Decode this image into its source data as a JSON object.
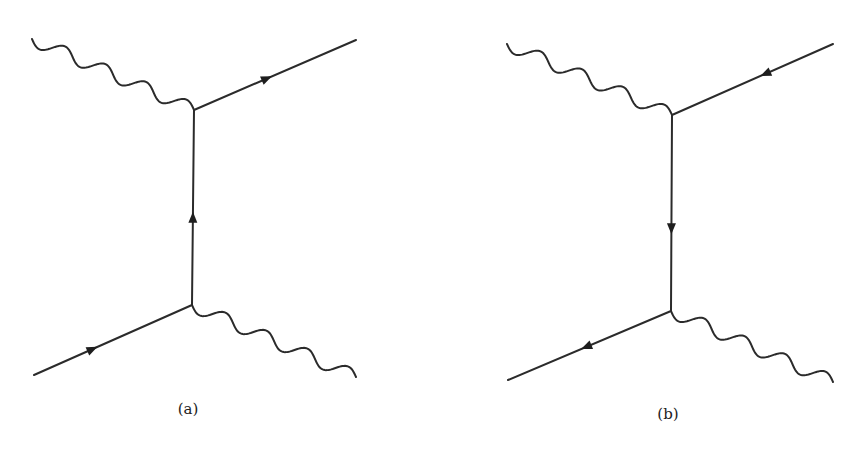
{
  "figure": {
    "type": "feynman-diagrams",
    "panels": [
      {
        "id": "a",
        "label": "(a)",
        "label_pos": [
          188,
          400
        ],
        "vertices": [
          [
            194,
            110
          ],
          [
            192,
            305
          ]
        ],
        "photons": [
          {
            "from": [
              32,
              39
            ],
            "to": [
              194,
              110
            ],
            "waves": 4
          },
          {
            "from": [
              192,
              305
            ],
            "to": [
              356,
              377
            ],
            "waves": 4
          }
        ],
        "fermions": [
          {
            "from": [
              194,
              110
            ],
            "to": [
              356,
              40
            ],
            "arrow_t": 0.45,
            "arrow_dir": "forward"
          },
          {
            "from": [
              192,
              305
            ],
            "to": [
              194,
              110
            ],
            "arrow_t": 0.45,
            "arrow_dir": "forward"
          },
          {
            "from": [
              34,
              375
            ],
            "to": [
              192,
              305
            ],
            "arrow_t": 0.37,
            "arrow_dir": "forward"
          }
        ]
      },
      {
        "id": "b",
        "label": "(b)",
        "label_pos": [
          668,
          405
        ],
        "vertices": [
          [
            672,
            115
          ],
          [
            671,
            311
          ]
        ],
        "photons": [
          {
            "from": [
              507,
              44
            ],
            "to": [
              672,
              115
            ],
            "waves": 4
          },
          {
            "from": [
              671,
              311
            ],
            "to": [
              833,
              382
            ],
            "waves": 4
          }
        ],
        "fermions": [
          {
            "from": [
              833,
              44
            ],
            "to": [
              672,
              115
            ],
            "arrow_t": 0.42,
            "arrow_dir": "forward"
          },
          {
            "from": [
              672,
              115
            ],
            "to": [
              671,
              311
            ],
            "arrow_t": 0.58,
            "arrow_dir": "forward"
          },
          {
            "from": [
              671,
              311
            ],
            "to": [
              508,
              380
            ],
            "arrow_t": 0.52,
            "arrow_dir": "forward"
          }
        ]
      }
    ]
  },
  "colors": {
    "stroke": "#2b2b2b",
    "background": "#ffffff"
  }
}
